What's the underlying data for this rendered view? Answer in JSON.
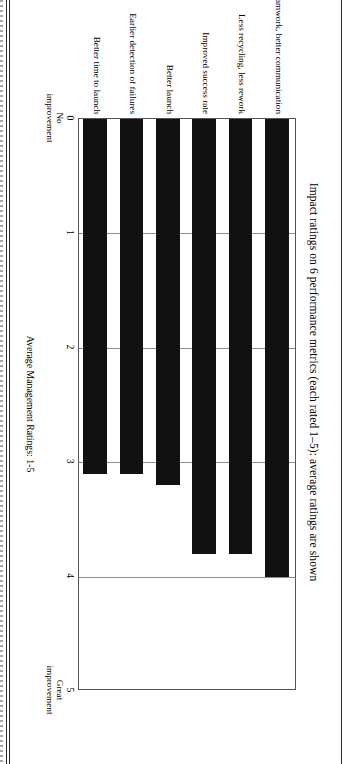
{
  "figure": {
    "title": "Impact ratings on 6 performance metrics (each rated 1–5): average ratings are shown",
    "xlabel": "Average Management Ratings: 1-5"
  },
  "chart_data": {
    "type": "bar",
    "orientation": "horizontal",
    "title": "Impact ratings on 6 performance metrics (each rated 1–5): average ratings are shown",
    "xlabel": "Average Management Ratings: 1-5",
    "ylabel": "",
    "xlim": [
      0,
      5
    ],
    "xticks": [
      0,
      1,
      2,
      3,
      4,
      5
    ],
    "xticklabels": [
      "0",
      "1",
      "2",
      "3",
      "4",
      "5"
    ],
    "xtick_captions": {
      "0": "No\nimprovement",
      "5": "Great\nimprovement"
    },
    "grid": true,
    "legend": false,
    "bar_color": "#111111",
    "categories": [
      "Improved teamwork, better communication",
      "Less recycling, less rework",
      "Improved success rate",
      "Better launch",
      "Earlier detection of failures",
      "Better time to launch"
    ],
    "values": [
      4.0,
      3.8,
      3.8,
      3.2,
      3.1,
      3.1
    ]
  },
  "axis": {
    "tick0": "0",
    "tick1": "1",
    "tick2": "2",
    "tick3": "3",
    "tick4": "4",
    "tick5": "5",
    "cap_low_line1": "No",
    "cap_low_line2": "improvement",
    "cap_high_line1": "Great",
    "cap_high_line2": "improvement"
  }
}
